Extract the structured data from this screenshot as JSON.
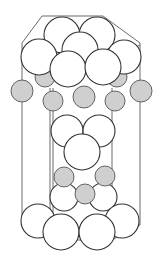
{
  "diagram": {
    "title": "Hexagonal unit cell (close-packed structure)",
    "type": "crystal-structure",
    "colors": {
      "large_atom_fill": "#ffffff",
      "large_atom_stroke": "#333333",
      "small_atom_fill": "#cfcfcf",
      "small_atom_stroke": "#555555",
      "cell_edge": "#5a5a5a",
      "background": "#ffffff"
    },
    "cell_edges": [
      {
        "x1": 42,
        "y1": 16,
        "x2": 103,
        "y2": 16
      },
      {
        "x1": 42,
        "y1": 16,
        "x2": 22,
        "y2": 43
      },
      {
        "x1": 103,
        "y1": 16,
        "x2": 140,
        "y2": 43
      },
      {
        "x1": 22,
        "y1": 43,
        "x2": 22,
        "y2": 225
      },
      {
        "x1": 140,
        "y1": 43,
        "x2": 140,
        "y2": 225
      },
      {
        "x1": 115,
        "y1": 58,
        "x2": 140,
        "y2": 45
      },
      {
        "x1": 50,
        "y1": 88,
        "x2": 50,
        "y2": 240
      },
      {
        "x1": 53,
        "y1": 88,
        "x2": 53,
        "y2": 240
      },
      {
        "x1": 112,
        "y1": 88,
        "x2": 112,
        "y2": 240
      },
      {
        "x1": 22,
        "y1": 225,
        "x2": 53,
        "y2": 240
      },
      {
        "x1": 53,
        "y1": 240,
        "x2": 112,
        "y2": 240
      },
      {
        "x1": 112,
        "y1": 240,
        "x2": 140,
        "y2": 225
      }
    ],
    "atoms": {
      "hidden_small": [
        {
          "cx": 45,
          "cy": 77,
          "r": 10
        },
        {
          "cx": 117,
          "cy": 77,
          "r": 10
        }
      ],
      "top_layer_back": [
        {
          "cx": 62,
          "cy": 35,
          "r": 18
        },
        {
          "cx": 97,
          "cy": 35,
          "r": 18
        },
        {
          "cx": 80,
          "cy": 50,
          "r": 18
        },
        {
          "cx": 124,
          "cy": 57,
          "r": 17
        }
      ],
      "top_layer_front": [
        {
          "cx": 39,
          "cy": 57,
          "r": 18
        },
        {
          "cx": 68,
          "cy": 69,
          "r": 18
        },
        {
          "cx": 103,
          "cy": 67,
          "r": 18
        }
      ],
      "middle_small": [
        {
          "cx": 22,
          "cy": 91,
          "r": 11
        },
        {
          "cx": 53,
          "cy": 101,
          "r": 10
        },
        {
          "cx": 84,
          "cy": 97,
          "r": 11
        },
        {
          "cx": 115,
          "cy": 101,
          "r": 10
        },
        {
          "cx": 141,
          "cy": 91,
          "r": 11
        }
      ],
      "middle_large": [
        {
          "cx": 67,
          "cy": 131,
          "r": 16
        },
        {
          "cx": 99,
          "cy": 131,
          "r": 16
        },
        {
          "cx": 82,
          "cy": 152,
          "r": 18
        },
        {
          "cx": 84,
          "cy": 144,
          "r": 0
        }
      ],
      "lower_small": [
        {
          "cx": 64,
          "cy": 177,
          "r": 10
        },
        {
          "cx": 105,
          "cy": 176,
          "r": 10
        },
        {
          "cx": 85,
          "cy": 194,
          "r": 10
        }
      ],
      "bottom_large_back": [
        {
          "cx": 64,
          "cy": 197,
          "r": 14
        },
        {
          "cx": 103,
          "cy": 197,
          "r": 14
        }
      ],
      "bottom_large": [
        {
          "cx": 38,
          "cy": 221,
          "r": 17
        },
        {
          "cx": 122,
          "cy": 221,
          "r": 17
        },
        {
          "cx": 61,
          "cy": 232,
          "r": 18
        },
        {
          "cx": 97,
          "cy": 232,
          "r": 18
        }
      ]
    }
  }
}
